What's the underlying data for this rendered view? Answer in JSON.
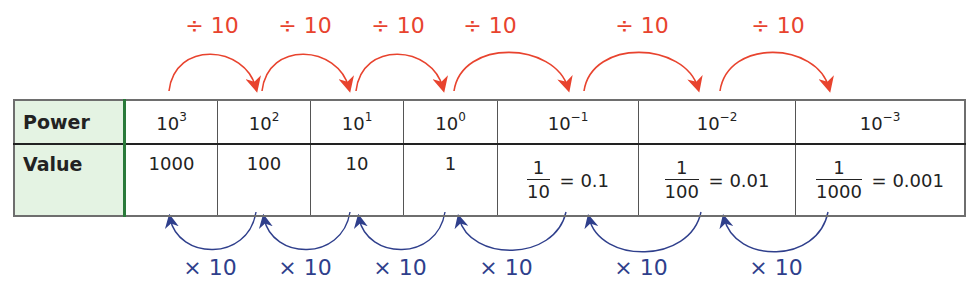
{
  "table": {
    "row_headers": [
      "Power",
      "Value"
    ],
    "columns": [
      {
        "base": "10",
        "exp": "3",
        "value": "1000",
        "fraction": null
      },
      {
        "base": "10",
        "exp": "2",
        "value": "100",
        "fraction": null
      },
      {
        "base": "10",
        "exp": "1",
        "value": "10",
        "fraction": null
      },
      {
        "base": "10",
        "exp": "0",
        "value": "1",
        "fraction": null
      },
      {
        "base": "10",
        "exp": "−1",
        "value": "0.1",
        "fraction": {
          "num": "1",
          "den": "10"
        }
      },
      {
        "base": "10",
        "exp": "−2",
        "value": "0.01",
        "fraction": {
          "num": "1",
          "den": "100"
        }
      },
      {
        "base": "10",
        "exp": "−3",
        "value": "0.001",
        "fraction": {
          "num": "1",
          "den": "1000"
        }
      }
    ],
    "equals": "="
  },
  "divide_arrows": {
    "label": "÷ 10",
    "color": "#e8432e",
    "items": [
      {
        "label": "÷ 10",
        "from": "10^3",
        "to": "10^2"
      },
      {
        "label": "÷ 10",
        "from": "10^2",
        "to": "10^1"
      },
      {
        "label": "÷ 10",
        "from": "10^1",
        "to": "10^0"
      },
      {
        "label": "÷ 10",
        "from": "10^0",
        "to": "10^-1"
      },
      {
        "label": "÷ 10",
        "from": "10^-1",
        "to": "10^-2"
      },
      {
        "label": "÷ 10",
        "from": "10^-2",
        "to": "10^-3"
      }
    ]
  },
  "multiply_arrows": {
    "label": "× 10",
    "color": "#2f3f8c",
    "items": [
      {
        "label": "× 10",
        "from": "10^2",
        "to": "10^3"
      },
      {
        "label": "× 10",
        "from": "10^1",
        "to": "10^2"
      },
      {
        "label": "× 10",
        "from": "10^0",
        "to": "10^1"
      },
      {
        "label": "× 10",
        "from": "10^-1",
        "to": "10^0"
      },
      {
        "label": "× 10",
        "from": "10^-2",
        "to": "10^-1"
      },
      {
        "label": "× 10",
        "from": "10^-3",
        "to": "10^-2"
      }
    ]
  }
}
